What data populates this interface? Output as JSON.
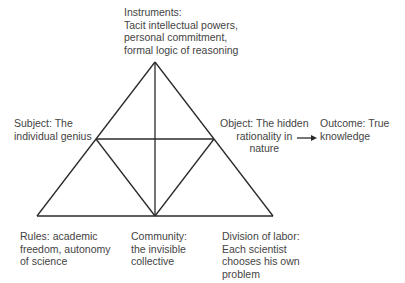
{
  "diagram": {
    "type": "activity-system-triangle",
    "nodes": {
      "instruments": "Instruments:\nTacit intellectual powers,\npersonal commitment,\nformal logic of reasoning",
      "subject": "Subject: The\nindividual genius",
      "object": "Object: The hidden\nrationality in\nnature",
      "outcome": "Outcome: True\nknowledge",
      "rules": "Rules: academic\nfreedom, autonomy\nof science",
      "community": "Community:\nthe invisible\ncollective",
      "division_of_labor": "Division of labor:\nEach scientist\nchooses his own\nproblem"
    },
    "edges": [
      {
        "from": "object",
        "to": "outcome",
        "style": "arrow"
      }
    ],
    "colors": {
      "line": "#2a2a2a",
      "text": "#444444",
      "background": "#ffffff"
    }
  }
}
